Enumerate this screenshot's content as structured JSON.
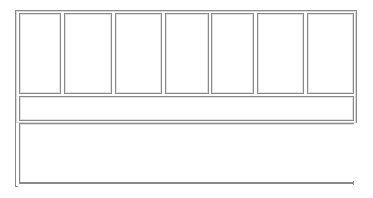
{
  "layout": {
    "columns": [
      {
        "id": "col-1",
        "label": ""
      },
      {
        "id": "col-2",
        "label": ""
      },
      {
        "id": "col-3",
        "label": ""
      },
      {
        "id": "col-4",
        "label": ""
      },
      {
        "id": "col-5",
        "label": ""
      },
      {
        "id": "col-6",
        "label": ""
      },
      {
        "id": "col-7",
        "label": ""
      }
    ],
    "middle_bar": {
      "label": ""
    },
    "bottom_panel": {
      "label": ""
    }
  },
  "colors": {
    "border": "#8a8a8a",
    "inner_border": "#e0e0e0",
    "background": "#ffffff"
  }
}
